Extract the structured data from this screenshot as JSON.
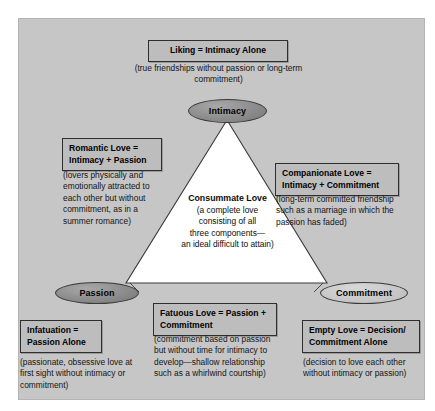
{
  "figure": {
    "panel_color": "#c6c6c6",
    "triangle_fill": "#ffffff",
    "triangle_stroke": "#3a3a3a",
    "node_dark_color": "#8e8e8e",
    "node_light_color": "#c6c6c6"
  },
  "nodes": {
    "intimacy": "Intimacy",
    "passion": "Passion",
    "commitment": "Commitment"
  },
  "center": {
    "heading": "Consummate Love",
    "line1": "(a complete love",
    "line2": "consisting of all",
    "line3": "three components—",
    "line4": "an ideal difficult to attain)"
  },
  "callouts": {
    "liking": {
      "title": "Liking = Intimacy Alone",
      "description": "(true friendships without passion or long-term commitment)"
    },
    "romantic": {
      "title": "Romantic Love = Intimacy + Passion",
      "description": "(lovers physically and emotionally attracted to each other but without commitment, as in a summer romance)"
    },
    "companionate": {
      "title": "Companionate Love = Intimacy + Commitment",
      "description": "(long-term committed friendship such as a marriage in which the passion has faded)"
    },
    "fatuous": {
      "title": "Fatuous Love = Passion + Commitment",
      "description": "(commitment based on passion but without time for intimacy to develop—shallow relationship such as a whirlwind courtship)"
    },
    "infatuation": {
      "title": "Infatuation = Passion Alone",
      "description": "(passionate, obsessive love at first sight without intimacy or commitment)"
    },
    "empty": {
      "title": "Empty Love = Decision/ Commitment Alone",
      "description": "(decision to love each other without intimacy or passion)"
    }
  }
}
